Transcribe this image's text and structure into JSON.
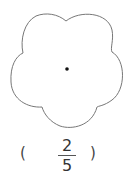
{
  "figure": {
    "shape": "five-petal flower outline with center dot",
    "stroke_color": "#777777",
    "dot_color": "#111111"
  },
  "answer": {
    "open_paren": "(",
    "numerator": "2",
    "denominator": "5",
    "close_paren": ")"
  }
}
